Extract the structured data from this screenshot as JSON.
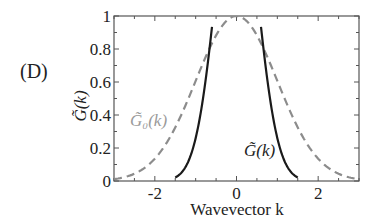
{
  "panel_label": "(D)",
  "colors": {
    "axis": "#555555",
    "solid_curve": "#1a1a1a",
    "dashed_curve": "#8c8c8c",
    "text": "#222222",
    "dashed_label": "#9a9a9a"
  },
  "chart_data": {
    "type": "line",
    "title": "",
    "xlabel": "Wavevector k",
    "ylabel": "G̃(k)",
    "xlim": [
      -3,
      3
    ],
    "ylim": [
      0,
      1
    ],
    "grid": false,
    "x_ticks": [
      -2,
      0,
      2
    ],
    "x_tick_labels": [
      "-2",
      "0",
      "2"
    ],
    "x_minor_ticks": [
      -3,
      -2.5,
      -1.5,
      -1,
      -0.5,
      0.5,
      1,
      1.5,
      2.5,
      3
    ],
    "y_ticks": [
      0,
      0.2,
      0.4,
      0.6,
      0.8,
      1
    ],
    "y_tick_labels": [
      "0",
      "0.2",
      "0.4",
      "0.6",
      "0.8",
      "1"
    ],
    "legend": "inline annotations",
    "annotations": [
      {
        "text": "G̃₀(k)",
        "near_x": -2.15,
        "near_y": 0.4,
        "color": "#9a9a9a"
      },
      {
        "text": "G̃(k)",
        "near_x": 0.9,
        "near_y": 0.15,
        "color": "#222222"
      }
    ],
    "series": [
      {
        "name": "G̃₀(k)",
        "style": "dashed",
        "color": "#8c8c8c",
        "x": [
          -3,
          -2.75,
          -2.5,
          -2.25,
          -2,
          -1.75,
          -1.5,
          -1.25,
          -1,
          -0.75,
          -0.5,
          -0.25,
          0,
          0.25,
          0.5,
          0.75,
          1,
          1.25,
          1.5,
          1.75,
          2,
          2.25,
          2.5,
          2.75,
          3
        ],
        "values": [
          0.011,
          0.023,
          0.044,
          0.08,
          0.135,
          0.216,
          0.325,
          0.458,
          0.607,
          0.755,
          0.882,
          0.969,
          1.0,
          0.969,
          0.882,
          0.755,
          0.607,
          0.458,
          0.325,
          0.216,
          0.135,
          0.08,
          0.044,
          0.023,
          0.011
        ]
      },
      {
        "name": "G̃(k)",
        "style": "solid",
        "color": "#1a1a1a",
        "x": [
          -1.5,
          -1.4,
          -1.3,
          -1.2,
          -1.1,
          -1.0,
          -0.9,
          -0.8,
          -0.7,
          -0.62,
          0.62,
          0.7,
          0.8,
          0.9,
          1.0,
          1.1,
          1.2,
          1.3,
          1.4,
          1.5
        ],
        "values": [
          0.022,
          0.038,
          0.065,
          0.107,
          0.171,
          0.26,
          0.38,
          0.535,
          0.719,
          1.0,
          1.0,
          0.719,
          0.535,
          0.38,
          0.26,
          0.171,
          0.107,
          0.065,
          0.038,
          0.022
        ],
        "note": "clipped at y=1 between k≈-0.62 and k≈0.62"
      }
    ]
  }
}
